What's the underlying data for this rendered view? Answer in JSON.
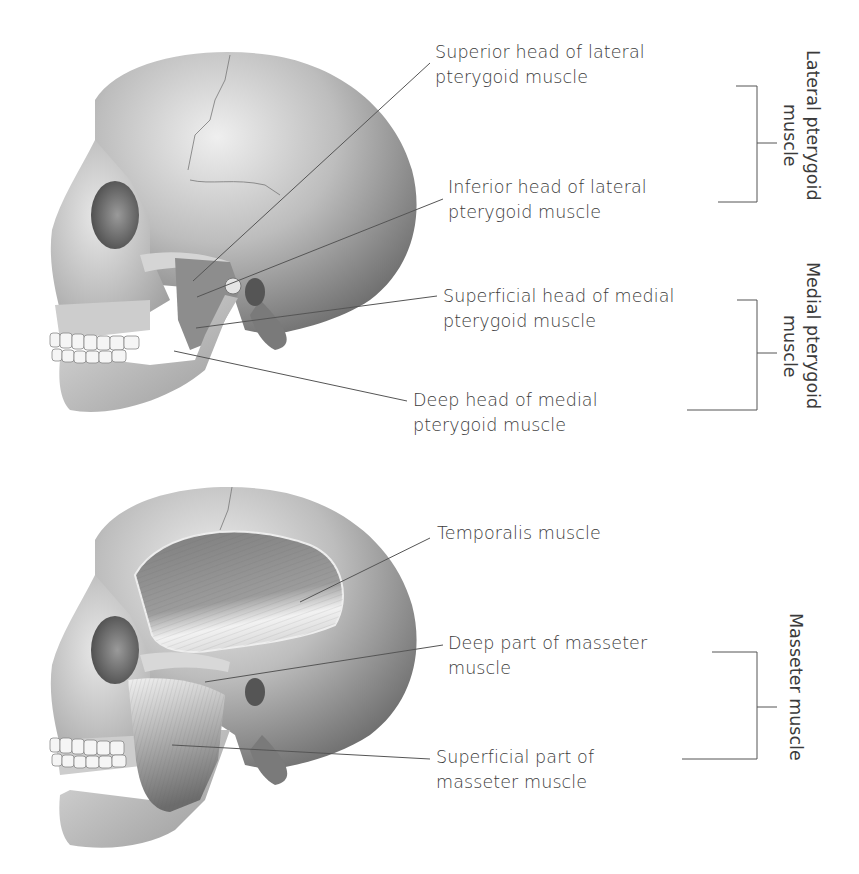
{
  "figure": {
    "top_panel": {
      "name": "Pterygoid muscles (lateral view of skull)",
      "labels": [
        {
          "id": "superior-lateral-pterygoid",
          "lines": [
            "Superior head of lateral",
            "pterygoid muscle"
          ]
        },
        {
          "id": "inferior-lateral-pterygoid",
          "lines": [
            "Inferior head of lateral",
            "pterygoid muscle"
          ]
        },
        {
          "id": "superficial-medial-pterygoid",
          "lines": [
            "Superficial head of medial",
            "pterygoid muscle"
          ]
        },
        {
          "id": "deep-medial-pterygoid",
          "lines": [
            "Deep head of medial",
            "pterygoid muscle"
          ]
        }
      ],
      "groups": [
        {
          "id": "lateral-pterygoid",
          "lines": [
            "Lateral pterygoid",
            "muscle"
          ]
        },
        {
          "id": "medial-pterygoid",
          "lines": [
            "Medial pterygoid",
            "muscle"
          ]
        }
      ]
    },
    "bottom_panel": {
      "name": "Temporalis and masseter muscles (lateral view of skull)",
      "labels": [
        {
          "id": "temporalis",
          "lines": [
            "Temporalis muscle"
          ]
        },
        {
          "id": "deep-masseter",
          "lines": [
            "Deep part of masseter",
            "muscle"
          ]
        },
        {
          "id": "superficial-masseter",
          "lines": [
            "Superficial part of",
            "masseter muscle"
          ]
        }
      ],
      "groups": [
        {
          "id": "masseter",
          "lines": [
            "Masseter muscle"
          ]
        }
      ]
    },
    "colors": {
      "text": "#3b3b3b",
      "leader_line": "#555555",
      "bone_light": "#e6e6e6",
      "bone_mid": "#b5b5b5",
      "bone_dark": "#6e6e6e",
      "muscle": "#8a8a8a",
      "background": "#ffffff"
    }
  }
}
